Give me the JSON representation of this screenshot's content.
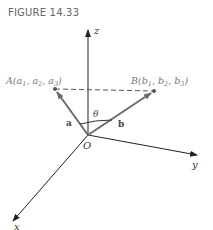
{
  "figure": {
    "title": "FIGURE 14.33"
  },
  "axes": {
    "x_label": "x",
    "y_label": "y",
    "z_label": "z",
    "origin_label": "O"
  },
  "points": {
    "A": {
      "name": "A",
      "label": "A(a",
      "sub1": "1",
      "mid1": ", a",
      "sub2": "2",
      "mid2": ", a",
      "sub3": "3",
      "end": ")"
    },
    "B": {
      "name": "B",
      "label": "B(b",
      "sub1": "1",
      "mid1": ", b",
      "sub2": "2",
      "mid2": ", b",
      "sub3": "3",
      "end": ")"
    }
  },
  "vectors": {
    "a_label": "a",
    "b_label": "b"
  },
  "angle": {
    "label": "θ"
  },
  "colors": {
    "axis": "#222222",
    "vector": "#6b6b6b",
    "label_gray": "#777777"
  }
}
